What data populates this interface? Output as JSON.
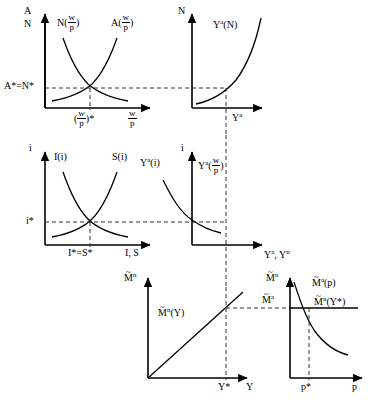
{
  "figure": {
    "type": "diagram",
    "panels": [
      {
        "id": "top-left",
        "name": "labor-market-panel",
        "y_axis_label_line1": "A",
        "y_axis_label_line2": "N",
        "x_axis_label_num": "w",
        "x_axis_label_den": "p",
        "curve_labels": [
          {
            "text_before": "N(",
            "num": "w",
            "den": "p",
            "text_after": ")"
          },
          {
            "text_before": "A(",
            "num": "w",
            "den": "p",
            "text_after": ")"
          }
        ],
        "equilibrium_y_label": "A*=N*",
        "equilibrium_x_label_prefix": "(",
        "equilibrium_x_num": "w",
        "equilibrium_x_den": "p",
        "equilibrium_x_label_suffix": ")*"
      },
      {
        "id": "top-right",
        "name": "production-function-panel",
        "y_axis_label": "N",
        "x_axis_label": "Y",
        "x_axis_label_sup": "a",
        "curve_label": "Y",
        "curve_label_sup": "a",
        "curve_label_arg": "(N)"
      },
      {
        "id": "mid-left",
        "name": "loanable-funds-panel",
        "y_axis_label": "i",
        "x_axis_label": "I, S",
        "curve_labels": [
          "I(i)",
          "S(i)"
        ],
        "equilibrium_y_label": "i*",
        "equilibrium_x_label": "I*=S*"
      },
      {
        "id": "mid-right",
        "name": "aggregate-supply-panel",
        "y_axis_label": "i",
        "x_axis_label": "Y",
        "x_axis_label_sup": "a",
        "x_axis_label_2": ", Y",
        "x_axis_label_sup2": "n",
        "curve_label_left": "Y",
        "curve_label_left_sup": "a",
        "curve_label_left_arg": "(i)",
        "curve_label_right": "Y",
        "curve_label_right_sup": "a",
        "curve_label_right_num": "w",
        "curve_label_right_den": "p"
      },
      {
        "id": "bottom-left",
        "name": "money-demand-income-panel",
        "y_axis_label_base": "M",
        "y_axis_label_sup": "n",
        "x_axis_label": "Y",
        "curve_label_base": "M",
        "curve_label_sup": "n",
        "curve_label_arg": "(Y)",
        "equilibrium_x_label": "Y*"
      },
      {
        "id": "bottom-right",
        "name": "money-market-price-panel",
        "y_axis_label_base": "M",
        "y_axis_label_sup": "n",
        "x_axis_label": "p",
        "side_label_base": "M",
        "side_label_sup": "a",
        "curve_label_base": "M",
        "curve_label_sup": "a",
        "curve_label_arg": "(p)",
        "horizontal_label_base": "M",
        "horizontal_label_sup": "n",
        "horizontal_label_arg": "(Y*)",
        "equilibrium_x_label": "p*"
      }
    ],
    "colors": {
      "stroke": "#000000",
      "dash": "#444444",
      "background": "#ffffff"
    }
  }
}
